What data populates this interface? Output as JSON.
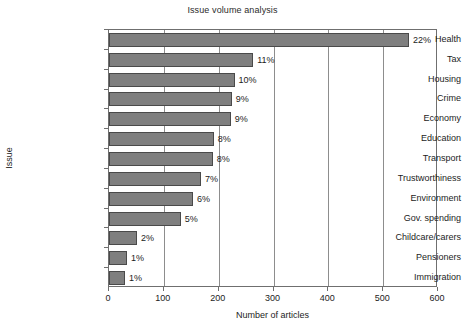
{
  "chart_data": {
    "type": "bar",
    "orientation": "horizontal",
    "title": "Issue volume analysis",
    "xlabel": "Number of articles",
    "ylabel": "Issue",
    "xlim": [
      0,
      600
    ],
    "xticks": [
      0,
      100,
      200,
      300,
      400,
      500,
      600
    ],
    "xtick_labels": [
      "0",
      "100",
      "200",
      "300",
      "400",
      "500",
      "600"
    ],
    "grid": "vertical",
    "legend": null,
    "categories": [
      "Health",
      "Tax",
      "Housing",
      "Crime",
      "Economy",
      "Education",
      "Transport",
      "Trustworthiness",
      "Environment",
      "Gov. spending",
      "Childcare/carers",
      "Pensioners",
      "Immigration"
    ],
    "values": [
      547,
      263,
      229,
      224,
      222,
      191,
      189,
      168,
      153,
      131,
      51,
      33,
      29
    ],
    "data_labels": [
      "22%",
      "11%",
      "10%",
      "9%",
      "9%",
      "8%",
      "8%",
      "7%",
      "6%",
      "5%",
      "2%",
      "1%",
      "1%"
    ],
    "bar_color": "#7f7f7f",
    "bar_edge_color": "#4a4a4a",
    "grid_color": "#8d8d8d",
    "axis_color": "#6f6f6f"
  }
}
